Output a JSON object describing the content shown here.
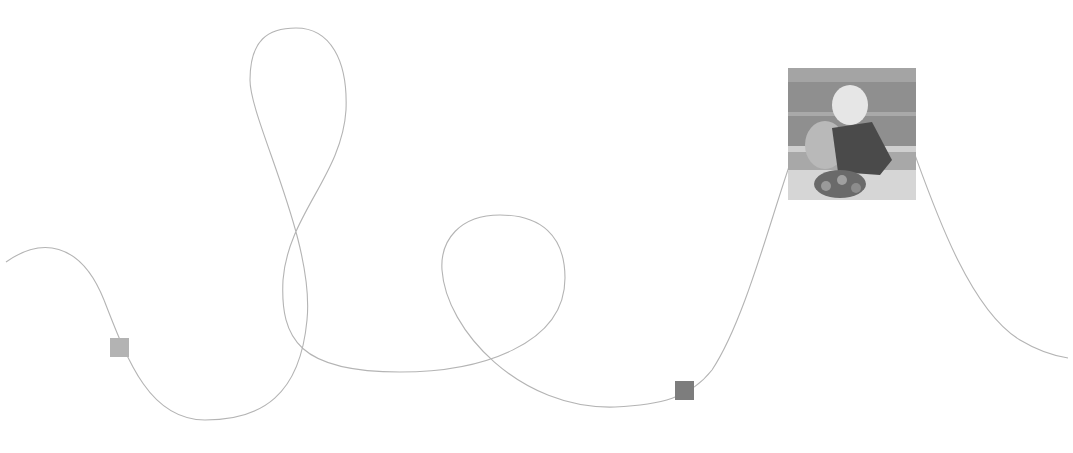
{
  "diagram": {
    "type": "freeform-curve-path",
    "curve_color": "#b4b4b4",
    "markers": [
      {
        "name": "marker-light",
        "color": "#b3b3b3"
      },
      {
        "name": "marker-dark",
        "color": "#7d7d7d"
      }
    ],
    "thumbnail": {
      "description": "grayscale photo of a blond child holding a stuffed toy",
      "tones": {
        "background": "#8f8f8f",
        "bench": "#cfcfcf",
        "hair": "#e6e6e6",
        "shirt": "#4a4a4a",
        "toy": "#b9b9b9",
        "flowers": "#6a6a6a"
      }
    }
  }
}
